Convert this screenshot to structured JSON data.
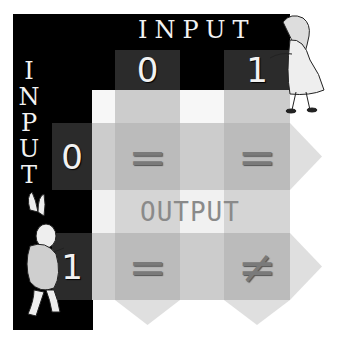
{
  "diagram": {
    "title_top": "INPUT",
    "title_left": [
      "I",
      "N",
      "P",
      "U",
      "T"
    ],
    "column_headers": [
      "0",
      "1"
    ],
    "row_headers": [
      "0",
      "1"
    ],
    "center_label": "OUTPUT",
    "cells": [
      [
        "=",
        "="
      ],
      [
        "=",
        "≠"
      ]
    ],
    "illustrations": [
      "alice-figure",
      "white-rabbit-figure"
    ],
    "colors": {
      "frame": "#000000",
      "header_cell": "#2b2b2b",
      "header_text": "#f2f2f2",
      "grid_light": "#e4e4e4",
      "band": "#c8c8c8",
      "symbol": "#7a7a7a",
      "output_text": "#8a8a8a"
    }
  }
}
